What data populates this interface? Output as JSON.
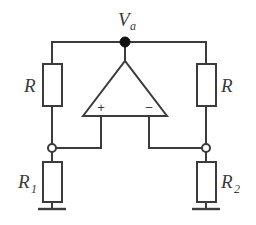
{
  "figure": {
    "kind": "schematic-diagram",
    "background_color": "#ffffff",
    "stroke_color": "#3b3b3b",
    "node_color": "#111111"
  },
  "nodes": {
    "output_node": {
      "label_main": "V",
      "label_sub": "a",
      "style": "filled",
      "x": 125,
      "y": 42,
      "label_x": 118,
      "label_y": 26,
      "label_sub_x": 130,
      "label_sub_y": 30
    },
    "left_tap": {
      "label": "",
      "style": "open",
      "x": 52,
      "y": 148
    },
    "right_tap": {
      "label": "",
      "style": "open",
      "x": 206,
      "y": 148
    }
  },
  "components": {
    "resistor_top_left": {
      "label_main": "R",
      "label_sub": "",
      "label_x": 24,
      "label_y": 92,
      "box_x": 43,
      "box_y": 64,
      "box_w": 19,
      "box_h": 42
    },
    "resistor_top_right": {
      "label_main": "R",
      "label_sub": "",
      "label_x": 221,
      "label_y": 92,
      "box_x": 197,
      "box_y": 64,
      "box_w": 19,
      "box_h": 42
    },
    "resistor_bottom_left": {
      "label_main": "R",
      "label_sub": "1",
      "label_x": 18,
      "label_y": 188,
      "label_sub_x": 31,
      "label_sub_y": 193,
      "box_x": 43,
      "box_y": 162,
      "box_w": 19,
      "box_h": 40
    },
    "resistor_bottom_right": {
      "label_main": "R",
      "label_sub": "2",
      "label_x": 221,
      "label_y": 188,
      "label_sub_x": 234,
      "label_sub_y": 193,
      "box_x": 197,
      "box_y": 162,
      "box_w": 19,
      "box_h": 40
    },
    "opamp": {
      "noninverting_label": "+",
      "inverting_label": "−",
      "noninverting_x": 101,
      "noninverting_y": 112,
      "inverting_x": 149,
      "inverting_y": 112,
      "apex_x": 125,
      "apex_y": 61,
      "base_left_x": 83,
      "base_right_x": 167,
      "base_y": 116
    }
  },
  "grounds": {
    "left": {
      "x": 52,
      "y": 209,
      "half_width": 14
    },
    "right": {
      "x": 206,
      "y": 209,
      "half_width": 14
    }
  },
  "wires": {
    "top_rail": "M52,42 L206,42",
    "left_top_drop": "M52,42 L52,64",
    "left_mid_drop": "M52,106 L52,148",
    "left_lower_drop": "M52,148 L52,162",
    "left_ground_stem": "M52,202 L52,209",
    "right_top_drop": "M206,42 L206,64",
    "right_mid_drop": "M206,106 L206,148",
    "right_lower_drop": "M206,148 L206,162",
    "right_ground_stem": "M206,202 L206,209",
    "opamp_output_stem": "M125,42 L125,61",
    "noninverting_feed": "M52,148 L101,148 L101,116",
    "inverting_feed": "M206,148 L149,148 L149,116"
  }
}
